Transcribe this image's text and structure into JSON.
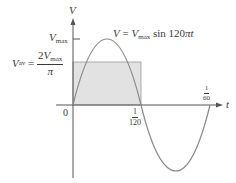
{
  "diagram": {
    "title_partial": "",
    "axes": {
      "y_axis_label": "V",
      "x_axis_label": "t",
      "origin_label": "0"
    },
    "equation": {
      "lhs": "V",
      "eq": " = ",
      "coef": "V",
      "coef_sub": "max",
      "rhs": " sin 120",
      "pi": "π",
      "var": "t"
    },
    "vmax_label": {
      "main": "V",
      "sub": "max"
    },
    "vav_label": {
      "main": "V",
      "sub": "av",
      "eq": " = ",
      "numerator_coef": "2",
      "numerator_var": "V",
      "numerator_sub": "max",
      "denominator": "π"
    },
    "tick_half_period": {
      "numerator": "1",
      "denominator": "120"
    },
    "tick_period": {
      "numerator": "1",
      "denominator": "60"
    },
    "colors": {
      "curve": "#8a8a8a",
      "axis": "#555555",
      "shade_fill": "#e2e2e2",
      "shade_stroke": "#9a9a9a",
      "text": "#3a3a3a"
    }
  }
}
